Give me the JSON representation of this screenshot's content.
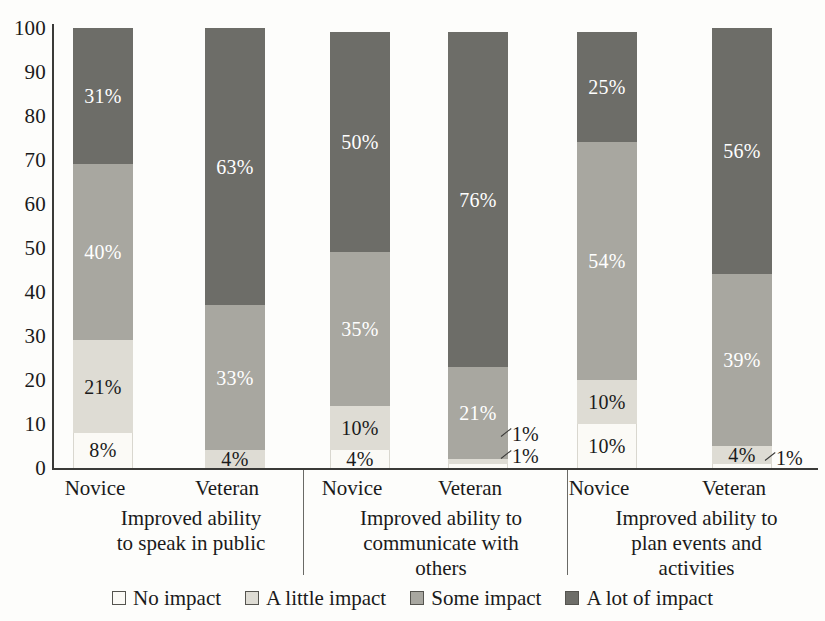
{
  "chart_data": {
    "type": "bar",
    "subtype": "stacked-100-percent-vertical",
    "title": "",
    "xlabel": "",
    "ylabel": "",
    "ylim": [
      0,
      100
    ],
    "yticks": [
      "0",
      "10",
      "20",
      "30",
      "40",
      "50",
      "60",
      "70",
      "80",
      "90",
      "100"
    ],
    "grid": false,
    "legend_position": "bottom",
    "stack_order_bottom_to_top": [
      "No impact",
      "A little impact",
      "Some impact",
      "A lot of impact"
    ],
    "categories": [
      "Novice",
      "Veteran"
    ],
    "series": [
      {
        "name": "No impact",
        "color": "#fbfaf6"
      },
      {
        "name": "A little impact",
        "color": "#dedcd4"
      },
      {
        "name": "Some impact",
        "color": "#a8a7a0"
      },
      {
        "name": "A lot of impact",
        "color": "#6d6d68"
      }
    ],
    "groups": [
      {
        "label": "Improved ability to speak in public",
        "label_lines": [
          "Improved ability",
          "to speak in public"
        ],
        "bars": [
          {
            "category": "Novice",
            "segments": [
              {
                "series": "No impact",
                "value": 8,
                "label": "8%",
                "label_color": "dark",
                "label_placement": "inside"
              },
              {
                "series": "A little impact",
                "value": 21,
                "label": "21%",
                "label_color": "dark",
                "label_placement": "inside"
              },
              {
                "series": "Some impact",
                "value": 40,
                "label": "40%",
                "label_color": "light",
                "label_placement": "inside"
              },
              {
                "series": "A lot of impact",
                "value": 31,
                "label": "31%",
                "label_color": "light",
                "label_placement": "inside"
              }
            ]
          },
          {
            "category": "Veteran",
            "segments": [
              {
                "series": "No impact",
                "value": 0,
                "label": "",
                "label_color": "dark",
                "label_placement": "none"
              },
              {
                "series": "A little impact",
                "value": 4,
                "label": "4%",
                "label_color": "dark",
                "label_placement": "inside"
              },
              {
                "series": "Some impact",
                "value": 33,
                "label": "33%",
                "label_color": "light",
                "label_placement": "inside"
              },
              {
                "series": "A lot of impact",
                "value": 63,
                "label": "63%",
                "label_color": "light",
                "label_placement": "inside"
              }
            ]
          }
        ]
      },
      {
        "label": "Improved ability to communicate with others",
        "label_lines": [
          "Improved ability to",
          "communicate with",
          "others"
        ],
        "bars": [
          {
            "category": "Novice",
            "segments": [
              {
                "series": "No impact",
                "value": 4,
                "label": "4%",
                "label_color": "dark",
                "label_placement": "inside"
              },
              {
                "series": "A little impact",
                "value": 10,
                "label": "10%",
                "label_color": "dark",
                "label_placement": "inside"
              },
              {
                "series": "Some impact",
                "value": 35,
                "label": "35%",
                "label_color": "light",
                "label_placement": "inside"
              },
              {
                "series": "A lot of impact",
                "value": 50,
                "label": "50%",
                "label_color": "light",
                "label_placement": "inside"
              }
            ]
          },
          {
            "category": "Veteran",
            "segments": [
              {
                "series": "No impact",
                "value": 1,
                "label": "1%",
                "label_color": "dark",
                "label_placement": "callout-right"
              },
              {
                "series": "A little impact",
                "value": 1,
                "label": "1%",
                "label_color": "dark",
                "label_placement": "callout-right"
              },
              {
                "series": "Some impact",
                "value": 21,
                "label": "21%",
                "label_color": "light",
                "label_placement": "inside"
              },
              {
                "series": "A lot of impact",
                "value": 76,
                "label": "76%",
                "label_color": "light",
                "label_placement": "inside"
              }
            ]
          }
        ]
      },
      {
        "label": "Improved ability to plan events and activities",
        "label_lines": [
          "Improved ability to",
          "plan events and",
          "activities"
        ],
        "bars": [
          {
            "category": "Novice",
            "segments": [
              {
                "series": "No impact",
                "value": 10,
                "label": "10%",
                "label_color": "dark",
                "label_placement": "inside"
              },
              {
                "series": "A little impact",
                "value": 10,
                "label": "10%",
                "label_color": "dark",
                "label_placement": "inside"
              },
              {
                "series": "Some impact",
                "value": 54,
                "label": "54%",
                "label_color": "light",
                "label_placement": "inside"
              },
              {
                "series": "A lot of impact",
                "value": 25,
                "label": "25%",
                "label_color": "light",
                "label_placement": "inside"
              }
            ]
          },
          {
            "category": "Veteran",
            "segments": [
              {
                "series": "No impact",
                "value": 1,
                "label": "1%",
                "label_color": "dark",
                "label_placement": "callout-right"
              },
              {
                "series": "A little impact",
                "value": 4,
                "label": "4%",
                "label_color": "dark",
                "label_placement": "inside"
              },
              {
                "series": "Some impact",
                "value": 39,
                "label": "39%",
                "label_color": "light",
                "label_placement": "inside"
              },
              {
                "series": "A lot of impact",
                "value": 56,
                "label": "56%",
                "label_color": "light",
                "label_placement": "inside"
              }
            ]
          }
        ]
      }
    ],
    "legend": [
      {
        "label": "No impact",
        "color": "#fbfaf6"
      },
      {
        "label": "A little impact",
        "color": "#dedcd4"
      },
      {
        "label": "Some impact",
        "color": "#a8a7a0"
      },
      {
        "label": "A lot of impact",
        "color": "#6d6d68"
      }
    ]
  }
}
